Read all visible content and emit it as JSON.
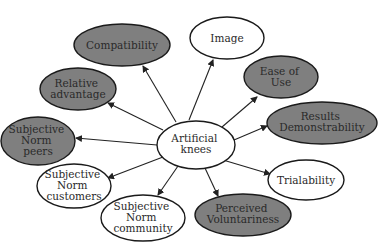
{
  "diagram": {
    "type": "mind-map",
    "colors": {
      "gray_fill": "#7f7f7f",
      "white_fill": "#ffffff",
      "stroke": "#1a1a1a",
      "text": "#2a2a2a"
    },
    "center": {
      "id": "artificial-knees",
      "lines": [
        "Artificial",
        "knees"
      ],
      "fill": "white"
    },
    "nodes": [
      {
        "id": "compatibility",
        "lines": [
          "Compatibility"
        ],
        "fill": "gray"
      },
      {
        "id": "image",
        "lines": [
          "Image"
        ],
        "fill": "white"
      },
      {
        "id": "relative-advantage",
        "lines": [
          "Relative",
          "advantage"
        ],
        "fill": "gray"
      },
      {
        "id": "ease-of-use",
        "lines": [
          "Ease of",
          "Use"
        ],
        "fill": "gray"
      },
      {
        "id": "results-demonstrability",
        "lines": [
          "Results",
          "Demonstrability"
        ],
        "fill": "gray"
      },
      {
        "id": "subjective-norm-peers",
        "lines": [
          "Subjective",
          "Norm",
          "peers"
        ],
        "fill": "gray"
      },
      {
        "id": "trialability",
        "lines": [
          "Trialability"
        ],
        "fill": "white"
      },
      {
        "id": "subjective-norm-customers",
        "lines": [
          "Subjective",
          "Norm",
          "customers"
        ],
        "fill": "white"
      },
      {
        "id": "subjective-norm-community",
        "lines": [
          "Subjective",
          "Norm",
          "community"
        ],
        "fill": "white"
      },
      {
        "id": "perceived-voluntariness",
        "lines": [
          "Perceived",
          "Voluntariness"
        ],
        "fill": "gray"
      }
    ],
    "edges": [
      {
        "from": "artificial-knees",
        "to": "compatibility"
      },
      {
        "from": "artificial-knees",
        "to": "image"
      },
      {
        "from": "artificial-knees",
        "to": "relative-advantage"
      },
      {
        "from": "artificial-knees",
        "to": "ease-of-use"
      },
      {
        "from": "artificial-knees",
        "to": "results-demonstrability"
      },
      {
        "from": "artificial-knees",
        "to": "subjective-norm-peers"
      },
      {
        "from": "artificial-knees",
        "to": "trialability"
      },
      {
        "from": "artificial-knees",
        "to": "subjective-norm-customers"
      },
      {
        "from": "artificial-knees",
        "to": "subjective-norm-community"
      },
      {
        "from": "artificial-knees",
        "to": "perceived-voluntariness"
      }
    ]
  }
}
